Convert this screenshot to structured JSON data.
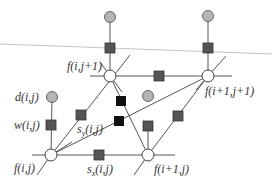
{
  "diagram": {
    "type": "factor-graph",
    "colors": {
      "line": "#555555",
      "thin_line": "#bbbbbb",
      "variable_node_fill": "#ffffff",
      "data_node_fill": "#b5b5b5",
      "factor_fill": "#555555",
      "black_factor_fill": "#111111"
    },
    "nodes": {
      "f_i_j1": {
        "label": "f(i,j+1)"
      },
      "f_i1_j1": {
        "label": "f(i+1,j+1)"
      },
      "f_i_j": {
        "label": "f(i,j)"
      },
      "f_i1_j": {
        "label": "f(i+1,j)"
      },
      "d_i_j": {
        "label": "d(i,j)"
      },
      "w_i_j": {
        "label": "w(i,j)"
      },
      "sy_i_j": {
        "label_main": "s",
        "label_sub": "y",
        "label_args": "(i,j)"
      },
      "sx_i_j": {
        "label_main": "s",
        "label_sub": "x",
        "label_args": "(i,j)"
      }
    }
  }
}
